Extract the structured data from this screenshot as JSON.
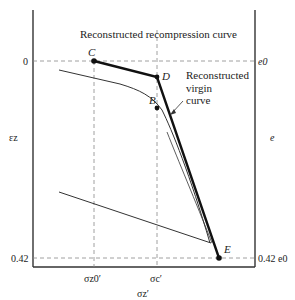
{
  "diagram": {
    "title_annotation": "Reconstructed recompression curve",
    "virgin_annotation": [
      "Reconstructed",
      "virgin",
      "curve"
    ],
    "left_axis": {
      "label": "εz",
      "ticks": [
        {
          "label": "0",
          "y": 61
        },
        {
          "label": "0.42",
          "y": 258
        }
      ]
    },
    "right_axis": {
      "label": "e",
      "ticks": [
        {
          "label": "e0",
          "y": 61
        },
        {
          "label": "0.42 e0",
          "y": 258
        }
      ]
    },
    "x_axis": {
      "label": "σz′",
      "ticks": [
        {
          "label": "σz0′",
          "x": 94
        },
        {
          "label": "σc′",
          "x": 157
        }
      ]
    },
    "points": [
      {
        "name": "C",
        "x": 94,
        "y": 61
      },
      {
        "name": "D",
        "x": 157,
        "y": 77
      },
      {
        "name": "B",
        "x": 157,
        "y": 108
      },
      {
        "name": "E",
        "x": 219,
        "y": 258
      }
    ],
    "colors": {
      "line": "#222222",
      "dashed": "#888888",
      "axis": "#333333"
    }
  }
}
